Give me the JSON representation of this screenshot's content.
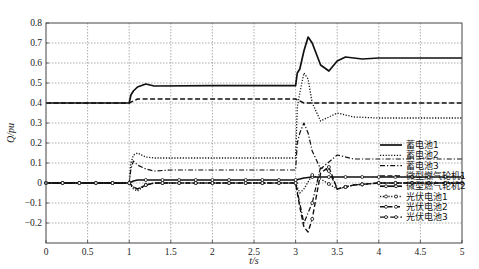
{
  "chart_data": {
    "type": "line",
    "title": "",
    "xlabel": "t/s",
    "ylabel": "Q/pu",
    "xlim": [
      0,
      5
    ],
    "ylim": [
      -0.3,
      0.8
    ],
    "grid": true,
    "legend_position": "lower right (inside)",
    "x_ticks": [
      "0",
      "0.5",
      "1",
      "1.5",
      "2",
      "2.5",
      "3",
      "3.5",
      "4",
      "4.5",
      "5"
    ],
    "y_ticks": [
      "0.8",
      "0.7",
      "0.6",
      "0.5",
      "0.4",
      "0.3",
      "0.2",
      "0.1",
      "0",
      "-0.1",
      "-0.2"
    ],
    "series": [
      {
        "name": "蓄电池1",
        "style": "solid",
        "x": [
          0,
          1.0,
          1.02,
          1.05,
          1.1,
          1.2,
          1.3,
          2.0,
          3.0,
          3.02,
          3.05,
          3.1,
          3.15,
          3.2,
          3.3,
          3.4,
          3.5,
          3.6,
          3.8,
          4.0,
          5.0
        ],
        "y": [
          0.4,
          0.4,
          0.44,
          0.46,
          0.48,
          0.495,
          0.485,
          0.487,
          0.487,
          0.55,
          0.57,
          0.66,
          0.73,
          0.7,
          0.59,
          0.56,
          0.61,
          0.63,
          0.62,
          0.625,
          0.625
        ]
      },
      {
        "name": "蓄电池2",
        "style": "dotted",
        "x": [
          0,
          1.0,
          1.02,
          1.05,
          1.1,
          1.2,
          1.3,
          2.0,
          3.0,
          3.02,
          3.05,
          3.1,
          3.15,
          3.2,
          3.3,
          3.5,
          3.7,
          4.0,
          5.0
        ],
        "y": [
          0.0,
          0.0,
          0.1,
          0.14,
          0.15,
          0.13,
          0.125,
          0.125,
          0.125,
          0.38,
          0.45,
          0.55,
          0.52,
          0.4,
          0.31,
          0.35,
          0.33,
          0.325,
          0.325
        ]
      },
      {
        "name": "蓄电池3",
        "style": "dashdot",
        "x": [
          0,
          1.0,
          1.02,
          1.05,
          1.1,
          1.2,
          1.3,
          1.5,
          2.0,
          3.0,
          3.02,
          3.05,
          3.1,
          3.15,
          3.2,
          3.3,
          3.5,
          3.7,
          4.0,
          5.0
        ],
        "y": [
          0.0,
          0.0,
          0.07,
          0.11,
          0.09,
          0.07,
          0.06,
          0.065,
          0.065,
          0.065,
          0.2,
          0.25,
          0.3,
          0.25,
          0.16,
          0.07,
          0.14,
          0.12,
          0.12,
          0.12
        ]
      },
      {
        "name": "微型燃气轮机1",
        "style": "dashed",
        "x": [
          0,
          1.0,
          1.05,
          1.1,
          2.0,
          3.0,
          3.1,
          3.2,
          4.0,
          5.0
        ],
        "y": [
          0.4,
          0.4,
          0.41,
          0.42,
          0.42,
          0.42,
          0.4,
          0.4,
          0.4,
          0.4
        ]
      },
      {
        "name": "微型燃气轮机2",
        "style": "solid-marker",
        "x": [
          0,
          1.0,
          1.05,
          1.1,
          2.0,
          3.0,
          3.05,
          3.1,
          3.2,
          4.0,
          5.0
        ],
        "y": [
          0.0,
          0.0,
          0.01,
          0.015,
          0.015,
          0.015,
          0.02,
          0.025,
          0.03,
          0.03,
          0.03
        ]
      },
      {
        "name": "光伏电池1",
        "style": "dotted-marker",
        "x": [
          0,
          1.0,
          1.05,
          1.1,
          1.2,
          1.3,
          2.0,
          3.0,
          3.05,
          3.1,
          3.2,
          3.3,
          3.5,
          3.7,
          4.0,
          5.0
        ],
        "y": [
          0.0,
          0.0,
          -0.03,
          -0.04,
          -0.01,
          0.0,
          0.0,
          0.0,
          -0.05,
          -0.03,
          0.04,
          0.02,
          -0.03,
          -0.01,
          0.0,
          0.0
        ]
      },
      {
        "name": "光伏电池2",
        "style": "dashed-marker",
        "x": [
          0,
          1.0,
          1.05,
          1.1,
          1.2,
          1.3,
          2.0,
          3.0,
          3.05,
          3.1,
          3.15,
          3.2,
          3.3,
          3.4,
          3.5,
          3.7,
          4.0,
          5.0
        ],
        "y": [
          0.0,
          0.0,
          -0.02,
          -0.03,
          -0.01,
          0.0,
          0.0,
          0.0,
          -0.12,
          -0.22,
          -0.245,
          -0.18,
          0.05,
          0.08,
          -0.03,
          -0.01,
          0.0,
          0.0
        ]
      },
      {
        "name": "光伏电池3",
        "style": "dashdot-marker",
        "x": [
          0,
          1.0,
          1.05,
          1.1,
          1.2,
          1.3,
          2.0,
          3.0,
          3.05,
          3.1,
          3.2,
          3.3,
          3.4,
          3.5,
          3.7,
          4.0,
          5.0
        ],
        "y": [
          0.0,
          0.0,
          -0.02,
          -0.03,
          -0.01,
          0.0,
          0.0,
          0.0,
          -0.1,
          -0.2,
          -0.1,
          0.08,
          0.06,
          -0.03,
          -0.01,
          0.0,
          0.0
        ]
      }
    ]
  },
  "legend": {
    "items": [
      "蓄电池1",
      "蓄电池2",
      "蓄电池3",
      "微型燃气轮机1",
      "微型燃气轮机2",
      "光伏电池1",
      "光伏电池2",
      "光伏电池3"
    ]
  },
  "colors": {
    "line": "#111111",
    "grid": "#8a8a8a",
    "axis": "#444444"
  }
}
